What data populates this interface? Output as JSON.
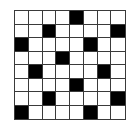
{
  "board": {
    "rows": 8,
    "cols": 8,
    "filled_color": "#000000",
    "empty_color": "#ffffff",
    "grid_line_color": "#3a3a3a",
    "cells": [
      [
        0,
        0,
        0,
        0,
        1,
        0,
        0,
        0
      ],
      [
        0,
        0,
        1,
        0,
        0,
        0,
        0,
        1
      ],
      [
        1,
        0,
        0,
        0,
        0,
        1,
        0,
        0
      ],
      [
        0,
        0,
        0,
        1,
        0,
        0,
        0,
        0
      ],
      [
        0,
        1,
        0,
        0,
        0,
        0,
        1,
        0
      ],
      [
        0,
        0,
        0,
        0,
        1,
        0,
        0,
        0
      ],
      [
        0,
        0,
        1,
        0,
        0,
        0,
        0,
        1
      ],
      [
        1,
        0,
        0,
        0,
        0,
        1,
        0,
        0
      ]
    ]
  }
}
